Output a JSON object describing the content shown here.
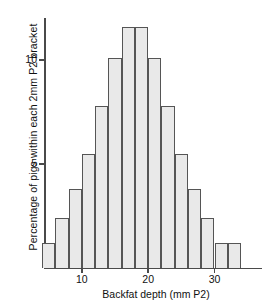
{
  "chart_data": {
    "type": "bar",
    "title": "",
    "subtitle": "",
    "xlabel": "Backfat depth (mm P2)",
    "ylabel": "Percentage of pigs within each 2mm P2 bracket",
    "bin_width": 2,
    "categories": [
      "5",
      "7",
      "9",
      "11",
      "13",
      "15",
      "17",
      "19",
      "21",
      "23",
      "25",
      "27",
      "29",
      "31",
      "33"
    ],
    "x": [
      5,
      7,
      9,
      11,
      13,
      15,
      17,
      19,
      21,
      23,
      25,
      27,
      29,
      31,
      33
    ],
    "values": [
      1.2,
      2.4,
      3.8,
      5.5,
      7.8,
      10.1,
      11.6,
      11.6,
      10.1,
      7.8,
      5.5,
      3.8,
      2.4,
      1.2,
      1.2
    ],
    "xlim": [
      4,
      35
    ],
    "ylim": [
      0,
      12
    ],
    "xticks": [
      10,
      20,
      30
    ],
    "xticklabels": [
      "10",
      "20",
      "30"
    ],
    "yticks": [
      5,
      10
    ],
    "yticklabels": [
      "5",
      "10"
    ],
    "grid": false,
    "legend": null,
    "bar_fill_color": "#e9e9e9",
    "bar_edge_color": "#555555",
    "axis_color": "#4a4a4a"
  }
}
